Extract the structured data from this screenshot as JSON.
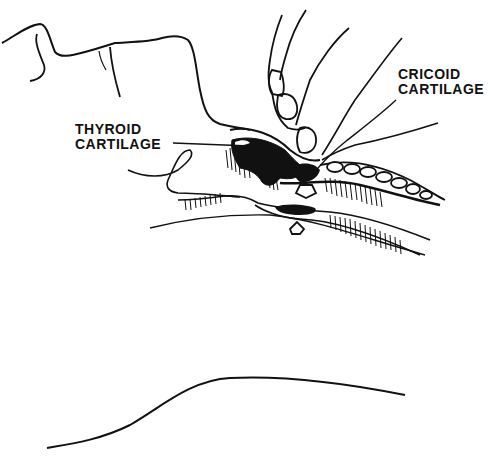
{
  "figure": {
    "type": "anatomical-line-illustration",
    "colors": {
      "ink": "#111111",
      "background": "#ffffff"
    }
  },
  "labels": {
    "thyroid": {
      "line1": "THYROID",
      "line2": "CARTILAGE"
    },
    "cricoid": {
      "line1": "CRICOID",
      "line2": "CARTILAGE"
    }
  },
  "arrows": [
    {
      "name": "pressure-arrow-down",
      "direction": "down"
    },
    {
      "name": "counter-arrow-up",
      "direction": "up"
    }
  ]
}
